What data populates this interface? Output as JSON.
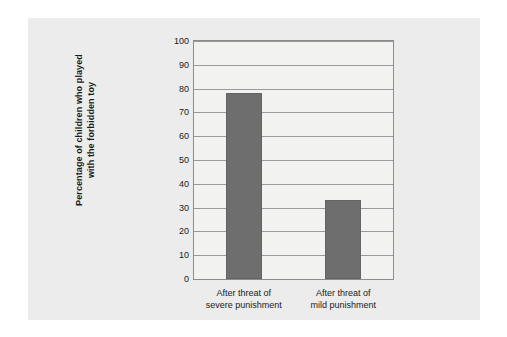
{
  "chart_data": {
    "type": "bar",
    "title": "",
    "subtitle": "",
    "xlabel": "",
    "ylabel": "Percentage of children who played with the forbidden toy",
    "ylabel_lines": [
      "Percentage of children who played",
      "with the forbidden toy"
    ],
    "categories": [
      "After threat of severe punishment",
      "After threat of mild punishment"
    ],
    "category_lines": [
      [
        "After threat of",
        "severe punishment"
      ],
      [
        "After threat of",
        "mild punishment"
      ]
    ],
    "values": [
      78,
      33
    ],
    "ylim": [
      0,
      100
    ],
    "ytick_step": 10,
    "yticks": [
      0,
      10,
      20,
      30,
      40,
      50,
      60,
      70,
      80,
      90,
      100
    ],
    "ytick_labels": [
      "0",
      "10",
      "20",
      "30",
      "40",
      "50",
      "60",
      "70",
      "80",
      "90",
      "100"
    ],
    "grid": true,
    "grid_axis": "y",
    "legend": false,
    "legend_position": "none",
    "colors": {
      "bar_fill": "#6e6e6e",
      "bar_border": "#646464",
      "gridline": "#9a9a9a",
      "plot_border": "#8c8c8c",
      "plot_background": "#f2f2f0",
      "panel_background": "#ebeceb",
      "page_background": "#ffffff",
      "text": "#1b1b1b"
    }
  }
}
